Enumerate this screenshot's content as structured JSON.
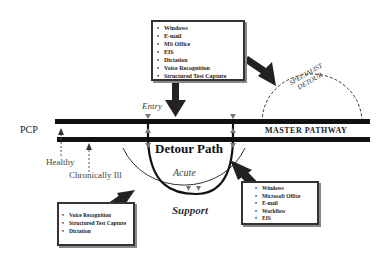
{
  "diagram": {
    "pcp_label": "PCP",
    "master_pathway_label": "MASTER PATHWAY",
    "entry_label": "Entry",
    "detour_path_label": "Detour Path",
    "acute_label": "Acute",
    "support_label": "Support",
    "healthy_label": "Healthy",
    "chronically_ill_label": "Chronically Ill",
    "specialist_detour_line1": "SPECIALIST",
    "specialist_detour_line2": "DETOUR"
  },
  "boxes": {
    "top": {
      "items": [
        "Windows",
        "E-mail",
        "MS Office",
        "EIS",
        "Dictation",
        "Voice Recognition",
        "Structured Test Capture"
      ]
    },
    "bottom_left": {
      "items": [
        "Voice Recognition",
        "Structured Test Capture",
        "Dictation"
      ]
    },
    "bottom_right": {
      "items": [
        "Windows",
        "Microsoft Office",
        "E-mail",
        "Workflow",
        "EIS"
      ]
    }
  },
  "colors": {
    "line": "#111111",
    "arrow": "#222222",
    "label_gray": "#555555"
  }
}
